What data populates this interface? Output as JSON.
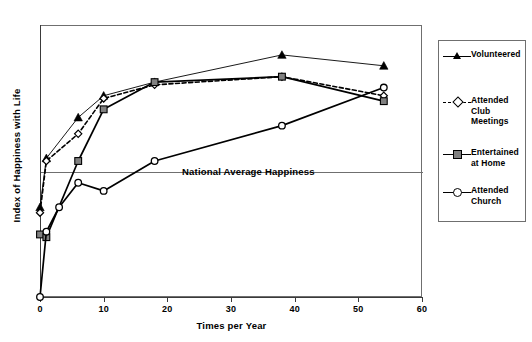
{
  "chart_data": {
    "type": "line",
    "title": "",
    "xlabel": "Times per Year",
    "ylabel": "Index of Happiness with Life",
    "xlim": [
      0,
      60
    ],
    "ylim": [
      0,
      10
    ],
    "xticks": [
      "0",
      "10",
      "20",
      "30",
      "40",
      "50",
      "60"
    ],
    "yticks": [],
    "grid": false,
    "legend_position": "right",
    "annotations": [
      {
        "text": "National Average Happiness",
        "type": "reference-line-label",
        "y_value": 5.0
      }
    ],
    "reference_lines": [
      {
        "name": "National Average Happiness",
        "y": 5.0
      }
    ],
    "series": [
      {
        "name": "Volunteered",
        "marker": "filled-triangle",
        "line_style": "solid",
        "color": "#000000",
        "x": [
          0,
          1,
          6,
          10,
          18,
          38,
          54
        ],
        "values": [
          3.3,
          5.1,
          6.6,
          7.4,
          7.9,
          8.9,
          8.5
        ]
      },
      {
        "name": "Attended Club Meetings",
        "marker": "open-diamond",
        "line_style": "dashed",
        "color": "#000000",
        "x": [
          0,
          1,
          6,
          10,
          18,
          38,
          54
        ],
        "values": [
          3.1,
          5.0,
          6.0,
          7.3,
          7.8,
          8.1,
          7.4
        ]
      },
      {
        "name": "Entertained at Home",
        "marker": "filled-square",
        "line_style": "solid",
        "color": "#000000",
        "x": [
          0,
          1,
          6,
          10,
          18,
          38,
          54
        ],
        "values": [
          2.3,
          2.2,
          5.0,
          6.9,
          7.9,
          8.1,
          7.2
        ]
      },
      {
        "name": "Attended Church",
        "marker": "open-circle",
        "line_style": "solid",
        "color": "#000000",
        "x": [
          0,
          1,
          3,
          6,
          10,
          18,
          38,
          54
        ],
        "values": [
          0.0,
          2.4,
          3.3,
          4.2,
          3.9,
          5.0,
          6.3,
          7.7
        ]
      }
    ]
  },
  "axes": {
    "x_title": "Times per Year",
    "y_title": "Index of Happiness with Life",
    "x_tick_labels": [
      "0",
      "10",
      "20",
      "30",
      "40",
      "50",
      "60"
    ]
  },
  "reference": {
    "label": "National Average Happiness"
  },
  "legend": {
    "items": [
      {
        "label": "Volunteered",
        "marker": "filled-triangle",
        "line": "solid"
      },
      {
        "label": "Attended Club Meetings",
        "marker": "open-diamond",
        "line": "dashed"
      },
      {
        "label": "Entertained at Home",
        "marker": "filled-square",
        "line": "solid"
      },
      {
        "label": "Attended Church",
        "marker": "open-circle",
        "line": "solid"
      }
    ]
  },
  "colors": {
    "line": "#000000",
    "frame": "#6f6f6f",
    "axis": "#3a3a3a",
    "square_fill": "#808080",
    "background": "#ffffff"
  }
}
